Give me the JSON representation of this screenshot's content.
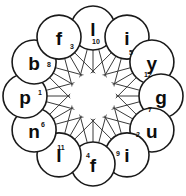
{
  "figure": {
    "background_color": "#ffffff",
    "outline_color": "#1a1a1a",
    "chord_color": "#3a3a3a",
    "text_color": "#0d0d0d",
    "center": {
      "x": 93,
      "y": 96
    },
    "ring_radius": 68,
    "node_radius": 22,
    "center_gap_radius": 23
  },
  "nodes": [
    {
      "id": 0,
      "letter": "l",
      "number": "10",
      "angle_deg": -90,
      "num_x": 96,
      "num_y": 41
    },
    {
      "id": 1,
      "letter": "i",
      "number": "5",
      "angle_deg": -60,
      "num_x": 131,
      "num_y": 52
    },
    {
      "id": 2,
      "letter": "y",
      "number": "12",
      "angle_deg": -30,
      "num_x": 148,
      "num_y": 74
    },
    {
      "id": 3,
      "letter": "g",
      "number": "7",
      "angle_deg": 0,
      "num_x": 150,
      "num_y": 109
    },
    {
      "id": 4,
      "letter": "u",
      "number": "2",
      "angle_deg": 30,
      "num_x": 138,
      "num_y": 134
    },
    {
      "id": 5,
      "letter": "i",
      "number": "9",
      "angle_deg": 60,
      "num_x": 118,
      "num_y": 153
    },
    {
      "id": 6,
      "letter": "f",
      "number": "4",
      "angle_deg": 90,
      "num_x": 88,
      "num_y": 155
    },
    {
      "id": 7,
      "letter": "l",
      "number": "11",
      "angle_deg": 120,
      "num_x": 61,
      "num_y": 147
    },
    {
      "id": 8,
      "letter": "n",
      "number": "6",
      "angle_deg": 150,
      "num_x": 43,
      "num_y": 124
    },
    {
      "id": 9,
      "letter": "p",
      "number": "1",
      "angle_deg": 180,
      "num_x": 40,
      "num_y": 92
    },
    {
      "id": 10,
      "letter": "b",
      "number": "8",
      "angle_deg": -150,
      "num_x": 49,
      "num_y": 64
    },
    {
      "id": 11,
      "letter": "f",
      "number": "3",
      "angle_deg": -120,
      "num_x": 72,
      "num_y": 46
    }
  ],
  "rim_edges": [
    [
      0,
      1
    ],
    [
      1,
      2
    ],
    [
      2,
      3
    ],
    [
      3,
      4
    ],
    [
      4,
      5
    ],
    [
      5,
      6
    ],
    [
      6,
      7
    ],
    [
      7,
      8
    ],
    [
      8,
      9
    ],
    [
      9,
      10
    ],
    [
      10,
      11
    ],
    [
      11,
      0
    ]
  ],
  "chords": [
    [
      0,
      5
    ],
    [
      0,
      6
    ],
    [
      0,
      7
    ],
    [
      1,
      6
    ],
    [
      1,
      7
    ],
    [
      1,
      8
    ],
    [
      2,
      7
    ],
    [
      2,
      8
    ],
    [
      2,
      9
    ],
    [
      3,
      8
    ],
    [
      3,
      9
    ],
    [
      3,
      10
    ],
    [
      4,
      9
    ],
    [
      4,
      10
    ],
    [
      4,
      11
    ],
    [
      5,
      10
    ],
    [
      5,
      11
    ],
    [
      6,
      11
    ]
  ]
}
